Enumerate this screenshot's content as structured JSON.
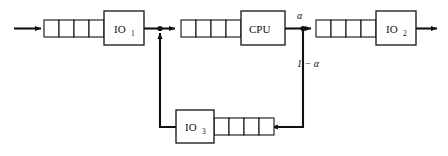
{
  "diagram": {
    "type": "queueing-network",
    "colors": {
      "background": "#ffffff",
      "stroke": "#111111",
      "fill": "#ffffff"
    },
    "stations": [
      {
        "id": "io1",
        "label": "IO",
        "subscript": "1",
        "box": {
          "x": 104,
          "y": 11,
          "w": 40,
          "h": 34
        },
        "queue": {
          "x": 44,
          "y": 20,
          "cells": 4,
          "cell_w": 15,
          "cell_h": 17
        }
      },
      {
        "id": "cpu",
        "label": "CPU",
        "subscript": "",
        "box": {
          "x": 241,
          "y": 11,
          "w": 44,
          "h": 34
        },
        "queue": {
          "x": 178,
          "y": 20,
          "cells": 4,
          "cell_w": 15,
          "cell_h": 17
        }
      },
      {
        "id": "io2",
        "label": "IO",
        "subscript": "2",
        "box": {
          "x": 375,
          "y": 11,
          "w": 40,
          "h": 34
        },
        "queue": {
          "x": 314,
          "y": 20,
          "cells": 4,
          "cell_w": 15,
          "cell_h": 17
        }
      },
      {
        "id": "io3",
        "label": "IO",
        "subscript": "3",
        "box": {
          "x": 176,
          "y": 110,
          "w": 38,
          "h": 33
        },
        "queue": {
          "x": 214,
          "y": 118,
          "cells": 4,
          "cell_w": 15,
          "cell_h": 17
        }
      }
    ],
    "branch_labels": [
      {
        "id": "alpha",
        "text": "α",
        "x": 297,
        "y": 19
      },
      {
        "id": "one-minus-alpha",
        "text": "1 − α",
        "x": 297,
        "y": 67
      }
    ],
    "junctions": [
      {
        "id": "merge-junction",
        "x": 160,
        "y": 28.5
      },
      {
        "id": "split-junction",
        "x": 303,
        "y": 28.5
      }
    ],
    "arrows": [
      {
        "id": "external-arrival",
        "from": "outside",
        "to": "io1-queue"
      },
      {
        "id": "io1-to-merge",
        "from": "io1",
        "to": "merge-junction"
      },
      {
        "id": "merge-to-cpu-queue",
        "from": "merge-junction",
        "to": "cpu-queue"
      },
      {
        "id": "cpu-to-split",
        "from": "cpu",
        "to": "split-junction"
      },
      {
        "id": "split-to-io2-queue",
        "from": "split-junction",
        "to": "io2-queue"
      },
      {
        "id": "io2-departure",
        "from": "io2",
        "to": "outside"
      },
      {
        "id": "split-to-io3-queue",
        "from": "split-junction",
        "to": "io3-queue"
      },
      {
        "id": "io3-to-merge",
        "from": "io3",
        "to": "merge-junction"
      }
    ]
  }
}
